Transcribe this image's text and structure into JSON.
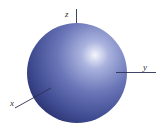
{
  "diagram": {
    "type": "3d-sphere-with-axes",
    "sphere": {
      "cx": 77,
      "cy": 73,
      "r": 50,
      "base_color": "#3d4a8f",
      "mid_color": "#6a78b8",
      "highlight_color": "#eef0fa"
    },
    "axes": {
      "z": {
        "label": "z",
        "line_color": "#2a2f55"
      },
      "y": {
        "label": "y",
        "line_color": "#2a2f55"
      },
      "x": {
        "label": "x",
        "line_color": "#2a2f55"
      }
    }
  }
}
